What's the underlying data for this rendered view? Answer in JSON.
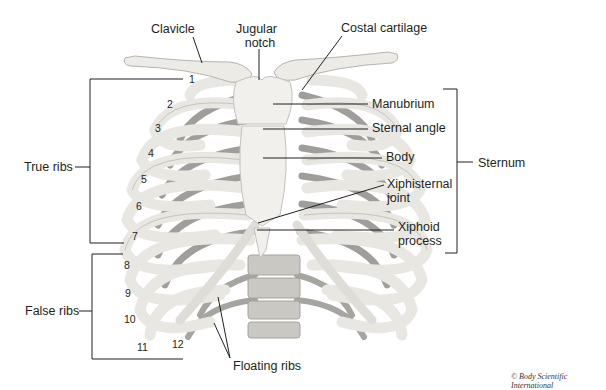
{
  "diagram": {
    "labels": {
      "clavicle": "Clavicle",
      "jugular_notch_line1": "Jugular",
      "jugular_notch_line2": "notch",
      "costal_cartilage": "Costal cartilage",
      "manubrium": "Manubrium",
      "sternal_angle": "Sternal angle",
      "body": "Body",
      "xiphisternal_line1": "Xiphisternal",
      "xiphisternal_line2": "joint",
      "xiphoid_line1": "Xiphoid",
      "xiphoid_line2": "process",
      "sternum": "Sternum",
      "true_ribs": "True ribs",
      "false_ribs": "False ribs",
      "floating_ribs": "Floating ribs"
    },
    "rib_numbers": [
      "1",
      "2",
      "3",
      "4",
      "5",
      "6",
      "7",
      "8",
      "9",
      "10",
      "11",
      "12"
    ],
    "copyright": "© Body Scientific International",
    "colors": {
      "bone": "#ecebe6",
      "bone_shadow": "#b9b8b2",
      "cartilage": "#d9d8d2",
      "posterior_rib": "#8f8e8a",
      "vertebra": "#c9c8c2",
      "leader": "#231f20"
    }
  }
}
